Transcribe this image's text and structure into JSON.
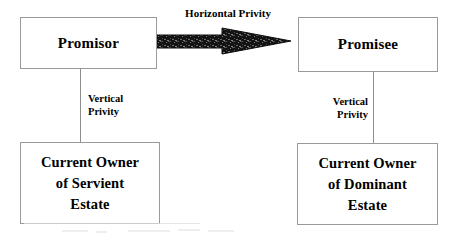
{
  "diagram": {
    "type": "flowchart",
    "nodes": [
      {
        "id": "promisor",
        "label": "Promisor"
      },
      {
        "id": "promisee",
        "label": "Promisee"
      },
      {
        "id": "servient",
        "label": "Current Owner\nof Servient\nEstate"
      },
      {
        "id": "dominant",
        "label": "Current Owner\nof Dominant\nEstate"
      }
    ],
    "edges": [
      {
        "id": "horizontal-privity",
        "from": "promisor",
        "to": "promisee",
        "label": "Horizontal Privity",
        "style": "block-arrow",
        "direction": "right"
      },
      {
        "id": "vertical-privity-left",
        "from": "promisor",
        "to": "servient",
        "label": "Vertical\nPrivity",
        "style": "plain-line",
        "direction": "down"
      },
      {
        "id": "vertical-privity-right",
        "from": "promisee",
        "to": "dominant",
        "label": "Vertical\nPrivity",
        "style": "plain-line",
        "direction": "down"
      }
    ]
  },
  "colors": {
    "background": "#ffffff",
    "box_border": "#9a9a9a",
    "box_fill": "#ffffff",
    "text": "#000000",
    "connector_line": "#8e8e8e",
    "arrow_fill": "#111111"
  }
}
